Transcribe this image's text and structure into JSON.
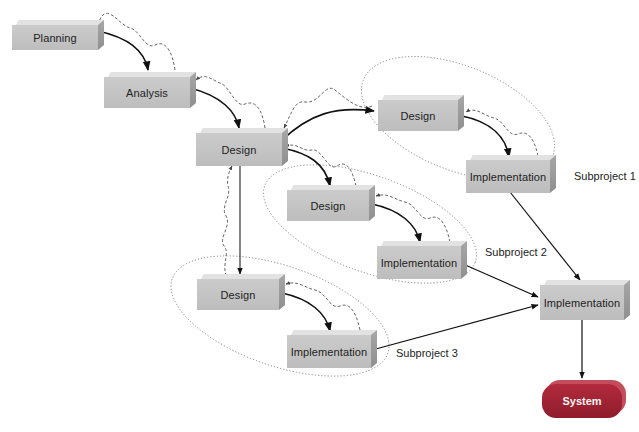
{
  "diagram": {
    "type": "incremental-development-model",
    "nodes": [
      {
        "id": "planning",
        "label": "Planning"
      },
      {
        "id": "analysis",
        "label": "Analysis"
      },
      {
        "id": "design-main",
        "label": "Design"
      },
      {
        "id": "sp1-design",
        "label": "Design"
      },
      {
        "id": "sp1-implementation",
        "label": "Implementation"
      },
      {
        "id": "sp2-design",
        "label": "Design"
      },
      {
        "id": "sp2-implementation",
        "label": "Implementation"
      },
      {
        "id": "sp3-design",
        "label": "Design"
      },
      {
        "id": "sp3-implementation",
        "label": "Implementation"
      },
      {
        "id": "final-implementation",
        "label": "Implementation"
      },
      {
        "id": "system",
        "label": "System"
      }
    ],
    "groups": [
      {
        "id": "subproject-1",
        "label": "Subproject 1"
      },
      {
        "id": "subproject-2",
        "label": "Subproject 2"
      },
      {
        "id": "subproject-3",
        "label": "Subproject 3"
      }
    ],
    "edges": [
      {
        "from": "planning",
        "to": "analysis",
        "style": "solid"
      },
      {
        "from": "analysis",
        "to": "design-main",
        "style": "solid"
      },
      {
        "from": "design-main",
        "to": "sp1-design",
        "style": "solid"
      },
      {
        "from": "design-main",
        "to": "sp2-design",
        "style": "solid"
      },
      {
        "from": "design-main",
        "to": "sp3-design",
        "style": "solid"
      },
      {
        "from": "sp1-design",
        "to": "sp1-implementation",
        "style": "solid"
      },
      {
        "from": "sp2-design",
        "to": "sp2-implementation",
        "style": "solid"
      },
      {
        "from": "sp3-design",
        "to": "sp3-implementation",
        "style": "solid"
      },
      {
        "from": "sp1-implementation",
        "to": "final-implementation",
        "style": "solid"
      },
      {
        "from": "sp2-implementation",
        "to": "final-implementation",
        "style": "solid"
      },
      {
        "from": "sp3-implementation",
        "to": "final-implementation",
        "style": "solid"
      },
      {
        "from": "final-implementation",
        "to": "system",
        "style": "solid"
      },
      {
        "from": "analysis",
        "to": "planning",
        "style": "dashed-wavy"
      },
      {
        "from": "design-main",
        "to": "analysis",
        "style": "dashed-wavy"
      },
      {
        "from": "sp1-design",
        "to": "design-main",
        "style": "dashed-wavy"
      },
      {
        "from": "sp2-design",
        "to": "design-main",
        "style": "dashed-wavy"
      },
      {
        "from": "sp3-design",
        "to": "design-main",
        "style": "dashed-wavy"
      },
      {
        "from": "sp1-implementation",
        "to": "sp1-design",
        "style": "dashed-wavy"
      },
      {
        "from": "sp2-implementation",
        "to": "sp2-design",
        "style": "dashed-wavy"
      },
      {
        "from": "sp3-implementation",
        "to": "sp3-design",
        "style": "dashed-wavy"
      }
    ]
  },
  "colors": {
    "box_front": "#c4c4c4",
    "box_top": "#e2e2e2",
    "box_side": "#9a9a9a",
    "system": "#a12536",
    "arrow": "#111111",
    "feedback": "#555555",
    "group_outline": "#777777"
  }
}
